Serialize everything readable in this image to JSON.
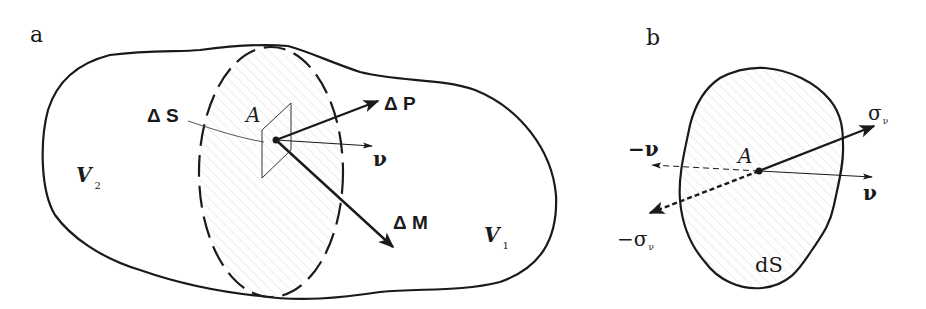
{
  "panels": {
    "a": {
      "label": "a",
      "region_labels": {
        "v2_main": "V",
        "v2_sub": "2",
        "v1_main": "V",
        "v1_sub": "1"
      },
      "point_label": "A",
      "surface_label": "Δ S",
      "vectors": {
        "force": "Δ P",
        "normal": "ν",
        "moment": "Δ M"
      }
    },
    "b": {
      "label": "b",
      "point_label": "A",
      "area_label": "dS",
      "vectors": {
        "stress_main": "σ",
        "stress_sub": "ν",
        "normal": "ν",
        "neg_normal": "−ν",
        "neg_stress_main": "−σ",
        "neg_stress_sub": "ν"
      }
    }
  },
  "colors": {
    "stroke": "#1a1a1a",
    "hatch": "#d9d9d9",
    "background": "#ffffff"
  }
}
